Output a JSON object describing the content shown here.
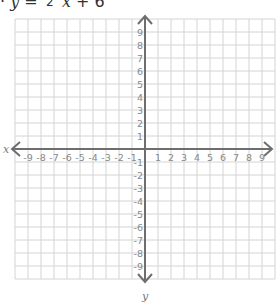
{
  "equation": {
    "prefix": "·",
    "lhs": "y",
    "equals": "=",
    "fraction_numerator": "",
    "fraction_denominator": "2",
    "variable": "x",
    "operator": "+",
    "constant": "6"
  },
  "graph": {
    "x_axis_label": "x",
    "y_axis_label": "y",
    "x_ticks": [
      "-9",
      "-8",
      "-7",
      "-6",
      "-5",
      "-4",
      "-3",
      "-2",
      "-1",
      "1",
      "2",
      "3",
      "4",
      "5",
      "6",
      "7",
      "8",
      "9"
    ],
    "y_ticks": [
      "9",
      "8",
      "7",
      "6",
      "5",
      "4",
      "3",
      "2",
      "1",
      "-1",
      "-2",
      "-3",
      "-4",
      "-5",
      "-6",
      "-7",
      "-8",
      "-9"
    ],
    "range": {
      "x_min": -10,
      "x_max": 10,
      "y_min": -10,
      "y_max": 10
    },
    "grid_color": "#d4d4d4",
    "axis_color": "#6e6e6e"
  }
}
